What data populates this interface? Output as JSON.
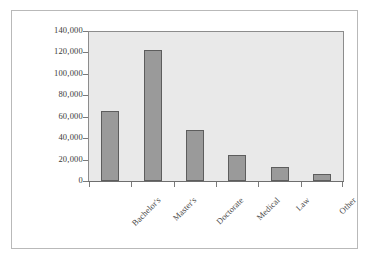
{
  "chart_data": {
    "type": "bar",
    "title": "",
    "subtitle": "",
    "xlabel": "",
    "ylabel": "",
    "categories": [
      "Bachelor's",
      "Master's",
      "Doctorate",
      "Medical",
      "Law",
      "Other"
    ],
    "values": [
      65000,
      122000,
      48000,
      24000,
      13000,
      7000
    ],
    "series": [
      {
        "name": "Degrees",
        "values": [
          65000,
          122000,
          48000,
          24000,
          13000,
          7000
        ]
      }
    ],
    "ylim": [
      0,
      140000
    ],
    "ytick_values": [
      0,
      20000,
      40000,
      60000,
      80000,
      100000,
      120000,
      140000
    ],
    "ytick_labels": [
      "0",
      "20,000",
      "40,000",
      "60,000",
      "80,000",
      "100,000",
      "120,000",
      "140,000"
    ],
    "grid": false,
    "legend": null,
    "legend_position": "none",
    "annotations": [],
    "colors": {
      "bar_fill": "#9a9a9a",
      "bar_border": "#5d5d5d",
      "plot_background": "#e9e9e9",
      "figure_background": "#ffffff",
      "figure_border": "#b9b9b9",
      "axis_line": "#8c8c8c",
      "tick_label": "#3a3a3a"
    }
  }
}
